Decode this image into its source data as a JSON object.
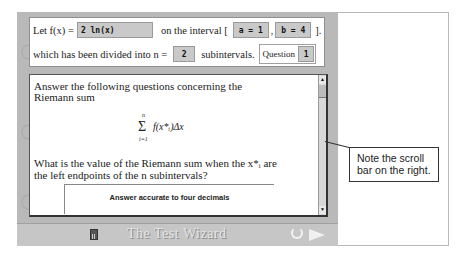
{
  "header": {
    "let_label": "Let f(x) =",
    "function_value": "2 ln(x)",
    "interval_label": "on the interval [",
    "a_value": "a = 1",
    "separator": ",",
    "b_value": "b = 4",
    "interval_close": "].",
    "divided_label": "which has been divided into n =",
    "n_value": "2",
    "subintervals_label": "subintervals.",
    "question_label": "Question",
    "question_number": "1"
  },
  "content": {
    "intro_line1": "Answer the following questions concerning the",
    "intro_line2": "Riemann sum",
    "sum": {
      "sigma": "Σ",
      "upper": "n",
      "lower": "i=1",
      "expression": "f(x*ᵢ)Δx"
    },
    "question_line1": "What is the value of the Riemann sum when the x*ᵢ are",
    "question_line2": "the left endpoints of the n subintervals?",
    "answer_label": "Answer accurate to four decimals"
  },
  "scrollbar": {
    "up_arrow": "▲",
    "down_arrow": "▼"
  },
  "footer": {
    "title": "The Test Wizard",
    "icons": [
      "calculator-icon",
      "undo-icon",
      "next-arrow-icon"
    ]
  },
  "callout": {
    "line1": "Note the scroll",
    "line2": "bar on the right."
  }
}
